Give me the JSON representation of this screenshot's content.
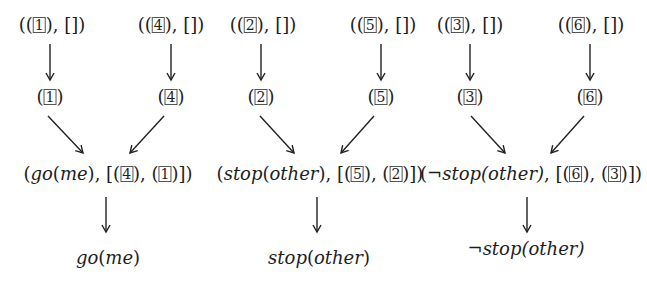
{
  "columns": [
    {
      "left_input": {
        "id": "1"
      },
      "right_input": {
        "id": "4"
      },
      "combined": {
        "formula": "go(me)",
        "list": [
          "4",
          "1"
        ],
        "negated": false
      },
      "result": {
        "formula": "go(me)",
        "negated": false
      }
    },
    {
      "left_input": {
        "id": "2"
      },
      "right_input": {
        "id": "5"
      },
      "combined": {
        "formula": "stop(other)",
        "list": [
          "5",
          "2"
        ],
        "negated": false
      },
      "result": {
        "formula": "stop(other)",
        "negated": false
      }
    },
    {
      "left_input": {
        "id": "3"
      },
      "right_input": {
        "id": "6"
      },
      "combined": {
        "formula": "stop(other)",
        "list": [
          "6",
          "3"
        ],
        "negated": true
      },
      "result": {
        "formula": "stop(other)",
        "negated": true
      }
    }
  ],
  "symbols": {
    "neg": "¬",
    "empty_list": "[]",
    "arrow_color": "#222222"
  },
  "texts": {
    "c0": {
      "l_top": "1",
      "r_top": "4",
      "l_mid": "1",
      "r_mid": "4",
      "comb_a": "go",
      "comb_b": "me",
      "comb_l1": "4",
      "comb_l2": "1",
      "res_a": "go",
      "res_b": "me"
    },
    "c1": {
      "l_top": "2",
      "r_top": "5",
      "l_mid": "2",
      "r_mid": "5",
      "comb_a": "stop",
      "comb_b": "other",
      "comb_l1": "5",
      "comb_l2": "2",
      "res_a": "stop",
      "res_b": "other"
    },
    "c2": {
      "l_top": "3",
      "r_top": "6",
      "l_mid": "3",
      "r_mid": "6",
      "comb_a": "stop",
      "comb_b": "other",
      "comb_l1": "6",
      "comb_l2": "3",
      "res_a": "stop",
      "res_b": "other",
      "neg": "¬"
    }
  }
}
